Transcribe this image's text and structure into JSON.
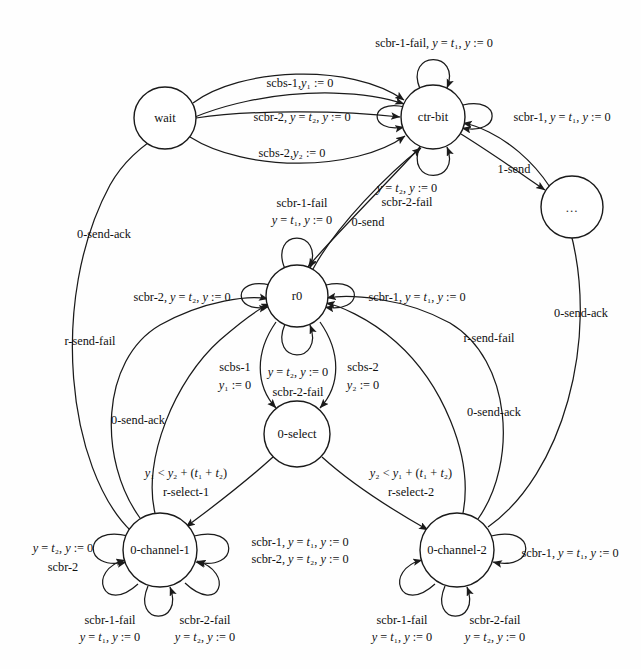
{
  "figure": {
    "type": "state-transition-diagram",
    "title": "",
    "background_color": "#fefefe",
    "stroke_color": "#1a1a1a"
  },
  "states": [
    {
      "id": "wait",
      "label": "wait",
      "cx": 165,
      "cy": 118,
      "r": 31
    },
    {
      "id": "ctr-bit",
      "label": "ctr-bit",
      "cx": 433,
      "cy": 117,
      "r": 32
    },
    {
      "id": "ellipsis",
      "label": "...",
      "cx": 572,
      "cy": 207,
      "r": 31
    },
    {
      "id": "r0",
      "label": "r0",
      "cx": 297,
      "cy": 296,
      "r": 31
    },
    {
      "id": "0-select",
      "label": "0-select",
      "cx": 297,
      "cy": 434,
      "r": 33
    },
    {
      "id": "0-channel-1",
      "label": "0-channel-1",
      "cx": 160,
      "cy": 550,
      "r": 37
    },
    {
      "id": "0-channel-2",
      "label": "0-channel-2",
      "cx": 457,
      "cy": 550,
      "r": 37
    }
  ],
  "labels": {
    "wait_to_ctrbit_top": "scbs-1,<i>y</i>₁ := 0",
    "wait_to_ctrbit_mid": "scbr-2, <i>y</i> = <i>t</i>₂, <i>y</i> := 0",
    "wait_to_ctrbit_bottom": "scbs-2,<i>y</i>₂ := 0",
    "ctrbit_self_top": "scbr-1-fail, <i>y</i> = <i>t</i>₁, <i>y</i> := 0",
    "ctrbit_self_right": "scbr-1, <i>y</i> = <i>t</i>₁, <i>y</i> := 0",
    "ctrbit_to_ellipsis": "1-send",
    "ctrbit_self_bottom_l1": "<i>y</i> = <i>t</i>₂, <i>y</i> := 0",
    "ctrbit_self_bottom_l2": "scbr-2-fail",
    "r0_to_ctrbit": "0-send",
    "r0_self_top_l1": "scbr-1-fail",
    "r0_self_top_l2": "<i>y</i> = <i>t</i>₁, <i>y</i> := 0",
    "r0_self_left": "scbr-2, <i>y</i> = <i>t</i>₂, <i>y</i> := 0",
    "r0_self_right": "scbr-1, <i>y</i> = <i>t</i>₁, <i>y</i> := 0",
    "r0_to_select_left_l1": "scbs-1",
    "r0_to_select_left_l2": "<i>y</i>₁ := 0",
    "r0_to_select_right_l1": "scbs-2",
    "r0_to_select_right_l2": "<i>y</i>₂ := 0",
    "select_self_l1": "<i>y</i> = <i>t</i>₂, <i>y</i> := 0",
    "select_self_l2": "scbr-2-fail",
    "select_to_ch1_l1": "<i>y</i>₁ &lt; <i>y</i>₂ + (<i>t</i>₁ + <i>t</i>₂)",
    "select_to_ch1_l2": "r-select-1",
    "select_to_ch2_l1": "<i>y</i>₂ &lt; <i>y</i>₁ + (<i>t</i>₁ + <i>t</i>₂)",
    "select_to_ch2_l2": "r-select-2",
    "ch1_self_left_l1": "<i>y</i> = <i>t</i>₂, <i>y</i> := 0",
    "ch1_self_left_l2": "scbr-2",
    "ch1_self_right_l1": "scbr-1, <i>y</i> = <i>t</i>₁, <i>y</i> := 0",
    "ch1_self_right_l2": "scbr-2, <i>y</i> = <i>t</i>₂, <i>y</i> := 0",
    "ch1_self_bl_l1": "scbr-1-fail",
    "ch1_self_bl_l2": "<i>y</i> = <i>t</i>₁, <i>y</i> := 0",
    "ch1_self_br_l1": "scbr-2-fail",
    "ch1_self_br_l2": "<i>y</i> = <i>t</i>₂, <i>y</i> := 0",
    "ch2_self_right": "scbr-1, <i>y</i> = <i>t</i>₁, <i>y</i> := 0",
    "ch2_self_bl_l1": "scbr-1-fail",
    "ch2_self_bl_l2": "<i>y</i> = <i>t</i>₁, <i>y</i> := 0",
    "ch2_self_br_l1": "scbr-2-fail",
    "ch2_self_br_l2": "<i>y</i> = <i>t</i>₂, <i>y</i> := 0",
    "ch1_to_ctrbit_sendack": "0-send-ack",
    "ch1_to_r0_rsendfail": "r-send-fail",
    "ch1_to_r0_sendack": "0-send-ack",
    "ch2_to_r0_rsendfail": "r-send-fail",
    "ch2_to_r0_sendack": "0-send-ack",
    "ch2_to_ctrbit_sendack": "0-send-ack"
  },
  "label_positions": {
    "wait_to_ctrbit_top": {
      "x": 300,
      "y": 83
    },
    "wait_to_ctrbit_mid": {
      "x": 302,
      "y": 117
    },
    "wait_to_ctrbit_bottom": {
      "x": 292,
      "y": 153
    },
    "ctrbit_self_top": {
      "x": 434,
      "y": 43
    },
    "ctrbit_self_right": {
      "x": 562,
      "y": 117
    },
    "ctrbit_to_ellipsis": {
      "x": 514,
      "y": 169
    },
    "ctrbit_self_bottom_l1": {
      "x": 407,
      "y": 188
    },
    "ctrbit_self_bottom_l2": {
      "x": 407,
      "y": 202
    },
    "r0_to_ctrbit": {
      "x": 368,
      "y": 222
    },
    "r0_self_top_l1": {
      "x": 302,
      "y": 203
    },
    "r0_self_top_l2": {
      "x": 302,
      "y": 220
    },
    "r0_self_left": {
      "x": 182,
      "y": 297
    },
    "r0_self_right": {
      "x": 417,
      "y": 297
    },
    "r0_to_select_left_l1": {
      "x": 235,
      "y": 367
    },
    "r0_to_select_left_l2": {
      "x": 235,
      "y": 385
    },
    "r0_to_select_right_l1": {
      "x": 363,
      "y": 367
    },
    "r0_to_select_right_l2": {
      "x": 363,
      "y": 385
    },
    "select_self_l1": {
      "x": 298,
      "y": 372
    },
    "select_self_l2": {
      "x": 298,
      "y": 392
    },
    "select_to_ch1_l1": {
      "x": 186,
      "y": 473
    },
    "select_to_ch1_l2": {
      "x": 186,
      "y": 492
    },
    "select_to_ch2_l1": {
      "x": 411,
      "y": 473
    },
    "select_to_ch2_l2": {
      "x": 411,
      "y": 492
    },
    "ch1_self_left_l1": {
      "x": 63,
      "y": 548
    },
    "ch1_self_left_l2": {
      "x": 63,
      "y": 567
    },
    "ch1_self_right_l1": {
      "x": 300,
      "y": 542
    },
    "ch1_self_right_l2": {
      "x": 300,
      "y": 559
    },
    "ch1_self_bl_l1": {
      "x": 110,
      "y": 620
    },
    "ch1_self_bl_l2": {
      "x": 110,
      "y": 637
    },
    "ch1_self_br_l1": {
      "x": 205,
      "y": 620
    },
    "ch1_self_br_l2": {
      "x": 205,
      "y": 637
    },
    "ch2_self_right": {
      "x": 570,
      "y": 553
    },
    "ch2_self_bl_l1": {
      "x": 402,
      "y": 620
    },
    "ch2_self_bl_l2": {
      "x": 402,
      "y": 637
    },
    "ch2_self_br_l1": {
      "x": 495,
      "y": 620
    },
    "ch2_self_br_l2": {
      "x": 495,
      "y": 637
    },
    "ch1_to_ctrbit_sendack": {
      "x": 104,
      "y": 234
    },
    "ch1_to_r0_rsendfail": {
      "x": 90,
      "y": 341
    },
    "ch1_to_r0_sendack": {
      "x": 138,
      "y": 420
    },
    "ch2_to_r0_rsendfail": {
      "x": 489,
      "y": 338
    },
    "ch2_to_r0_sendack": {
      "x": 494,
      "y": 412
    },
    "ch2_to_ctrbit_sendack": {
      "x": 581,
      "y": 313
    }
  }
}
